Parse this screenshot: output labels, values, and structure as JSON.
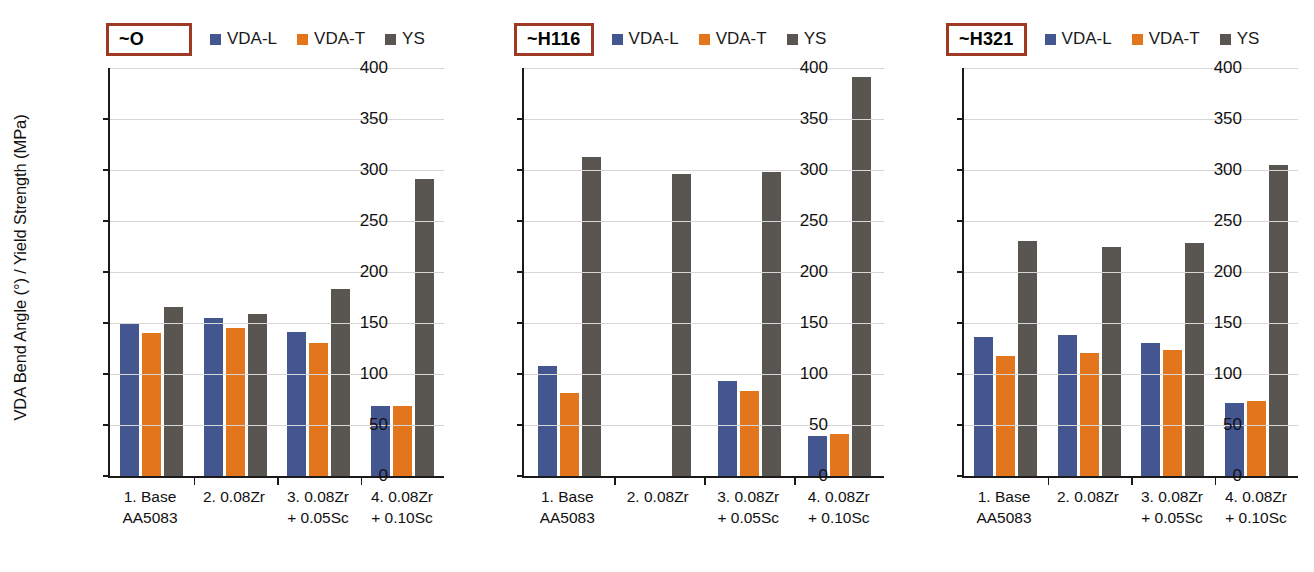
{
  "axis": {
    "ylabel": "VDA Bend Angle (°) / Yield Strength (MPa)",
    "yticks": [
      "400",
      "350",
      "300",
      "250",
      "200",
      "150",
      "100",
      "50",
      "0"
    ]
  },
  "legend": {
    "items": [
      {
        "label": "VDA-L",
        "color": "#44568f",
        "icon": "legend-swatch-square"
      },
      {
        "label": "VDA-T",
        "color": "#e3761d",
        "icon": "legend-swatch-square"
      },
      {
        "label": "YS",
        "color": "#595651",
        "icon": "legend-swatch-square"
      }
    ]
  },
  "panels": [
    {
      "badge": "~O"
    },
    {
      "badge": "~H116"
    },
    {
      "badge": "~H321"
    }
  ],
  "chart_data": {
    "type": "bar",
    "title": "",
    "xlabel": "",
    "ylabel": "VDA Bend Angle (°) / Yield Strength (MPa)",
    "ylim": [
      0,
      400
    ],
    "ytick_step": 50,
    "grid": true,
    "legend_position": "top",
    "categories": [
      "1. Base\nAA5083",
      "2. 0.08Zr",
      "3. 0.08Zr\n+ 0.05Sc",
      "4. 0.08Zr\n+ 0.10Sc"
    ],
    "panels": [
      {
        "name": "~O",
        "series": [
          {
            "name": "VDA-L",
            "color": "#44568f",
            "values": [
              150,
              155,
              141,
              69
            ]
          },
          {
            "name": "VDA-T",
            "color": "#e3761d",
            "values": [
              140,
              145,
              130,
              69
            ]
          },
          {
            "name": "YS",
            "color": "#595651",
            "values": [
              166,
              159,
              183,
              291
            ]
          }
        ]
      },
      {
        "name": "~H116",
        "series": [
          {
            "name": "VDA-L",
            "color": "#44568f",
            "values": [
              108,
              null,
              93,
              39
            ]
          },
          {
            "name": "VDA-T",
            "color": "#e3761d",
            "values": [
              81,
              null,
              83,
              41
            ]
          },
          {
            "name": "YS",
            "color": "#595651",
            "values": [
              313,
              296,
              298,
              391
            ]
          }
        ]
      },
      {
        "name": "~H321",
        "series": [
          {
            "name": "VDA-L",
            "color": "#44568f",
            "values": [
              136,
              138,
              130,
              72
            ]
          },
          {
            "name": "VDA-T",
            "color": "#e3761d",
            "values": [
              118,
              121,
              124,
              74
            ]
          },
          {
            "name": "YS",
            "color": "#595651",
            "values": [
              230,
              225,
              228,
              305
            ]
          }
        ]
      }
    ]
  }
}
